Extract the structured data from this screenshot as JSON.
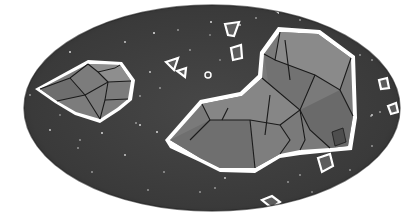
{
  "image": {
    "description": "Grayscale illustration of asteroids/rock clusters floating in starry space, framed within an ellipse",
    "colors": {
      "background": "#ffffff",
      "space": "#3e3e3e",
      "space_edge": "#2a2a2a",
      "rock_light": "#8a8a8a",
      "rock_mid": "#777777",
      "rock_dark": "#5e5e5e",
      "outline": "#ffffff",
      "line": "#1a1a1a",
      "star": "#d8d8d8"
    },
    "objects": [
      {
        "name": "left-asteroid"
      },
      {
        "name": "large-asteroid-cluster"
      },
      {
        "name": "small-debris"
      }
    ]
  }
}
